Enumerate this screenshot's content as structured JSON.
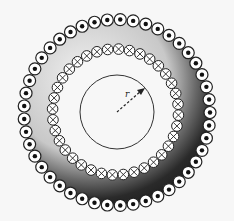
{
  "figure": {
    "radius_label": "r",
    "outer_ring": {
      "symbol": "dot",
      "meaning": "current-out-of-page",
      "count": 45
    },
    "inner_ring": {
      "symbol": "cross",
      "meaning": "current-into-page",
      "count": 36
    },
    "colors": {
      "background": "#f7f7f7",
      "band_dark": "#1e1e1e",
      "band_light": "#b0b0b0",
      "stroke": "#222222",
      "conductor_fill": "#ffffff"
    }
  }
}
